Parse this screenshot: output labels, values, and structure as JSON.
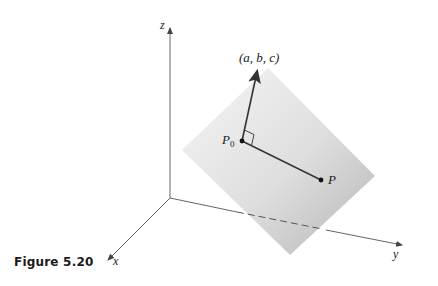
{
  "figure": {
    "caption": "Figure 5.20",
    "axes": {
      "x": "x",
      "y": "y",
      "z": "z"
    },
    "normal_vector_label": "(a, b, c)",
    "point_labels": {
      "p0_main": "P",
      "p0_sub": "0",
      "p": "P"
    },
    "colors": {
      "plane_light": "#f4f4f4",
      "plane_dark": "#b9b9b9",
      "axis": "#555555",
      "vector": "#333333"
    }
  }
}
